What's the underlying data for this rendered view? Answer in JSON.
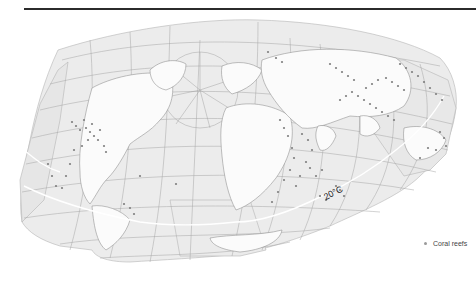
{
  "map": {
    "projection": "interrupted world projection",
    "colors": {
      "ocean_fill": "#ececec",
      "land_fill": "#fbfbfb",
      "graticule": "#9e9e9e",
      "coastline": "#8a8a8a",
      "reef_dot": "#7f7f7f",
      "isotherm": "#ffffff",
      "top_rule": "#2b2b2b"
    },
    "isotherm_label": "20°C",
    "legend": {
      "items": [
        {
          "symbol": "dot",
          "label": "Coral reefs"
        }
      ]
    }
  }
}
